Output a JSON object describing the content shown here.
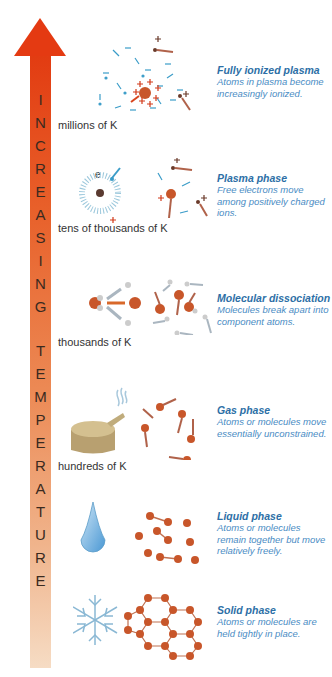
{
  "arrow": {
    "label_letters": [
      "I",
      "N",
      "C",
      "R",
      "E",
      "A",
      "S",
      "I",
      "N",
      "G",
      " ",
      "T",
      "E",
      "M",
      "P",
      "E",
      "R",
      "A",
      "T",
      "U",
      "R",
      "E"
    ],
    "label": "INCREASING TEMPERATURE",
    "color_top": "#e23c12",
    "color_bottom": "#f6dcc4"
  },
  "temperatures": [
    {
      "label": "millions of K"
    },
    {
      "label": "tens of thousands of K"
    },
    {
      "label": "thousands of K"
    },
    {
      "label": "hundreds of K"
    }
  ],
  "phases": [
    {
      "title": "Fully ionized plasma",
      "description": "Atoms in plasma become increasingly ionized.",
      "icon": "plasma-ions-icon"
    },
    {
      "title": "Plasma phase",
      "description": "Free electrons move among positively charged ions.",
      "icon": "electron-atom-icon"
    },
    {
      "title": "Molecular dissociation",
      "description": "Molecules break apart into component atoms.",
      "icon": "molecule-break-icon"
    },
    {
      "title": "Gas phase",
      "description": "Atoms or molecules move essentially unconstrained.",
      "icon": "kettle-steam-icon"
    },
    {
      "title": "Liquid phase",
      "description": "Atoms or molecules remain together but move relatively freely.",
      "icon": "water-drop-icon"
    },
    {
      "title": "Solid phase",
      "description": "Atoms or molecules are held tightly in place.",
      "icon": "snowflake-icon"
    }
  ],
  "annotations": {
    "electron_symbol": "e",
    "plus": "+",
    "minus": "−"
  },
  "colors": {
    "title_blue": "#2d6fa6",
    "desc_blue": "#4a8cc4",
    "atom": "#c8562a",
    "ion_cyan": "#3a9cc8"
  }
}
